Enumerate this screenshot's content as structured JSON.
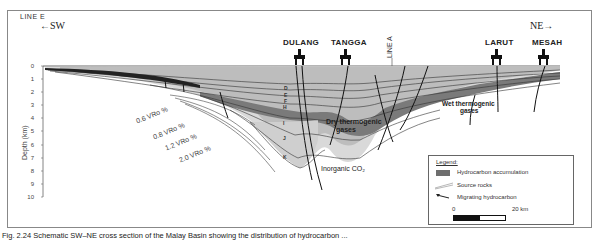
{
  "diagram": {
    "line_label": "LINE  E",
    "direction_left": "SW",
    "direction_right": "NE",
    "cross_line_label": "LINE  A",
    "wells": [
      {
        "name": "DULANG",
        "x": 300
      },
      {
        "name": "TANGGA",
        "x": 346
      },
      {
        "name": "LARUT",
        "x": 497
      },
      {
        "name": "MESAH",
        "x": 544
      }
    ],
    "y_axis": {
      "label": "Depth  (km)",
      "ticks": [
        "0",
        "1",
        "2",
        "3",
        "4",
        "5",
        "6",
        "7",
        "8",
        "9",
        "10"
      ]
    },
    "vro_labels": [
      "0.6  VRo  %",
      "0.8  VRo  %",
      "1.2  VRo  %",
      "2.0  VRo  %"
    ],
    "strata_labels": [
      "D",
      "E",
      "F",
      "H",
      "I",
      "J",
      "K"
    ],
    "annotations": {
      "dry_gas": "Dry thermogenic",
      "dry_gas_2": "gases",
      "wet_gas": "Wet thermogenic",
      "wet_gas_2": "gases",
      "co2": "Inorganic CO₂"
    },
    "legend": {
      "title": "Legend:",
      "items": [
        {
          "label": "Hydrocarbon accumulation",
          "symbol": "dark-fill"
        },
        {
          "label": "Source rocks",
          "symbol": "thin-lines"
        },
        {
          "label": "Migrating hydrocarbon",
          "symbol": "arrow"
        }
      ],
      "scale": {
        "start": "0",
        "end": "20  km"
      }
    },
    "colors": {
      "hydrocarbon": "#6e6e6e",
      "strata_light": "#d6d6d6",
      "strata_mid": "#a8a8a8",
      "frame": "#888888"
    }
  },
  "caption": "Fig. 2.24  Schematic SW–NE cross section of the Malay Basin showing the distribution of hydrocarbon ..."
}
